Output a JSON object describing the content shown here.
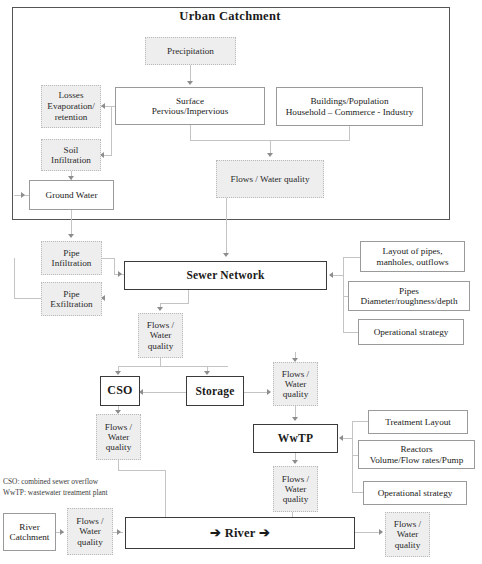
{
  "diagram": {
    "title": "Urban Catchment",
    "catchment": {
      "precipitation": "Precipitation",
      "losses": "Losses\nEvaporation/\nretention",
      "soil": "Soil\nInfiltration",
      "ground_water": "Ground Water",
      "surface": "Surface\nPervious/Impervious",
      "buildings": "Buildings/Population\nHousehold – Commerce - Industry",
      "flows": "Flows / Water quality"
    },
    "sewer": {
      "pipe_infiltration": "Pipe\nInfiltration",
      "pipe_exfiltration": "Pipe\nExfiltration",
      "sewer_network": "Sewer Network",
      "flows_sewer": "Flows /\nWater\nquality",
      "layout_pipes": "Layout of pipes,\nmanholes, outflows",
      "pipes_diameter": "Pipes\nDiameter/roughness/depth",
      "operational_strategy": "Operational strategy"
    },
    "treatment": {
      "cso": "CSO",
      "storage": "Storage",
      "flows_cso": "Flows /\nWater\nquality",
      "flows_storage": "Flows /\nWater\nquality",
      "wwtp": "WwTP",
      "flows_wwtp": "Flows /\nWater\nquality",
      "treatment_layout": "Treatment Layout",
      "reactors": "Reactors\nVolume/Flow rates/Pump",
      "operational_strategy": "Operational strategy"
    },
    "river": {
      "river_catchment": "River\nCatchment",
      "flows_in": "Flows /\nWater\nquality",
      "river": "➔  River ➔",
      "flows_out": "Flows /\nWater\nquality"
    },
    "legend": {
      "line1": "CSO: combined sewer overflow",
      "line2": "WwTP: wastewater treatment plant"
    },
    "colors": {
      "shade_fill": "#eeeeee",
      "shade_border": "#b9b9b9",
      "plain_border": "#9a9a9a",
      "strong_border": "#3a3a3a",
      "connector": "#c4c4c4",
      "frame": "#555555"
    }
  }
}
